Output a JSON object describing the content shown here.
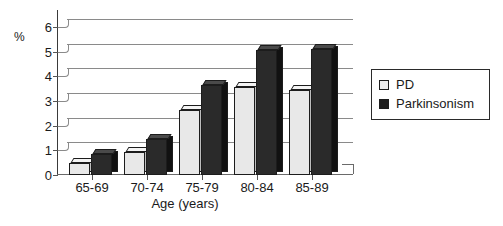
{
  "chart_data": {
    "type": "bar",
    "title": "",
    "subtitle": "",
    "xlabel": "Age (years)",
    "ylabel": "%",
    "categories": [
      "65-69",
      "70-74",
      "75-79",
      "80-84",
      "85-89"
    ],
    "series": [
      {
        "name": "PD",
        "color": "#ededed",
        "values": [
          0.5,
          0.95,
          2.65,
          3.55,
          3.45
        ]
      },
      {
        "name": "Parkinsonism",
        "color": "#1e1e1e",
        "values": [
          0.85,
          1.45,
          3.65,
          5.05,
          5.1
        ]
      }
    ],
    "ylim": [
      0,
      6
    ],
    "yticks": [
      0,
      1,
      2,
      3,
      4,
      5,
      6
    ],
    "ytick_labels": [
      "0",
      "1",
      "2",
      "3",
      "4",
      "5",
      "6"
    ],
    "grid": true,
    "grid_axis": "y",
    "legend_position": "right",
    "style": "3d-column"
  },
  "legend": {
    "entries": [
      {
        "label": "PD",
        "swatch": "light-gray-square"
      },
      {
        "label": "Parkinsonism",
        "swatch": "black-square"
      }
    ]
  }
}
